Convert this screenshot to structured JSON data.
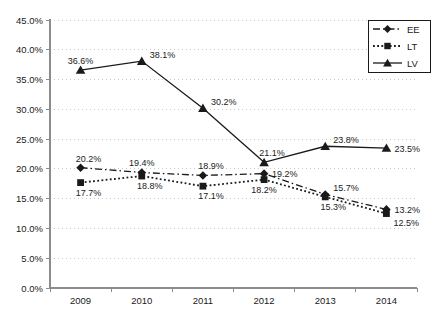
{
  "chart_data": {
    "type": "line",
    "title": "",
    "categories": [
      "2009",
      "2010",
      "2011",
      "2012",
      "2013",
      "2014"
    ],
    "series": [
      {
        "name": "EE",
        "values": [
          20.2,
          19.4,
          18.9,
          19.2,
          15.7,
          13.2
        ],
        "marker": "diamond",
        "line_style": "dash-dot",
        "color": "#1a1a1a",
        "label_pos": [
          "above-right",
          "above",
          "above-right",
          "right",
          "right-above",
          "right"
        ]
      },
      {
        "name": "LT",
        "values": [
          17.7,
          18.8,
          17.1,
          18.2,
          15.3,
          12.5
        ],
        "marker": "square",
        "line_style": "dotted",
        "color": "#1a1a1a",
        "label_pos": [
          "below-right",
          "below-right",
          "below-right",
          "below",
          "below-right",
          "right-below"
        ]
      },
      {
        "name": "LV",
        "values": [
          36.6,
          38.1,
          30.2,
          21.1,
          23.8,
          23.5
        ],
        "marker": "triangle",
        "line_style": "solid",
        "color": "#1a1a1a",
        "label_pos": [
          "above",
          "right-above",
          "right-above",
          "above-right",
          "right-above",
          "right"
        ]
      }
    ],
    "data_labels": true,
    "data_label_format": "percent1",
    "ylim": [
      0,
      45
    ],
    "ytick_step": 5,
    "ytick_format": "percent1",
    "xlabel": "",
    "ylabel": "",
    "grid": "horizontal-dotted",
    "legend_position": "top-right",
    "legend_entries": [
      "EE",
      "LT",
      "LV"
    ],
    "colors": {
      "grid": "#c9c9c9",
      "axis": "#8c8c8c",
      "text": "#1a1a1a",
      "background": "#ffffff",
      "legend_border": "#1a1a1a"
    }
  }
}
